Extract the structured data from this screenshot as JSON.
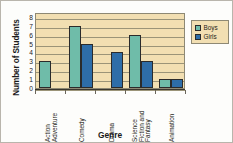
{
  "chart_data": {
    "type": "bar",
    "title": "",
    "xlabel": "Genre",
    "ylabel": "Number of Students",
    "categories": [
      "Action Adventure",
      "Comedy",
      "Drama",
      "Science Fiction and Fantasy",
      "Animation"
    ],
    "category_lines": [
      [
        "Action",
        "Adventure"
      ],
      [
        "Comedy"
      ],
      [
        "Drama"
      ],
      [
        "Science",
        "Fiction and",
        "Fantasy"
      ],
      [
        "Animation"
      ]
    ],
    "series": [
      {
        "name": "Boys",
        "color": "#6FBCA9",
        "values": [
          3,
          7,
          0,
          6,
          1
        ]
      },
      {
        "name": "Girls",
        "color": "#2E6DA8",
        "values": [
          0,
          5,
          4,
          3,
          1
        ]
      }
    ],
    "yticks": [
      8,
      7,
      6,
      5,
      4,
      3,
      2,
      1,
      0
    ],
    "ylim": [
      0,
      8
    ],
    "grid": true,
    "legend_position": "right",
    "plot_background": "#F2DFB2",
    "gridline_color": "#9B9478"
  },
  "legend": {
    "items": [
      {
        "label": "Boys"
      },
      {
        "label": "Girls"
      }
    ]
  },
  "axes": {
    "y_title": "Number of Students",
    "x_title": "Genre"
  }
}
